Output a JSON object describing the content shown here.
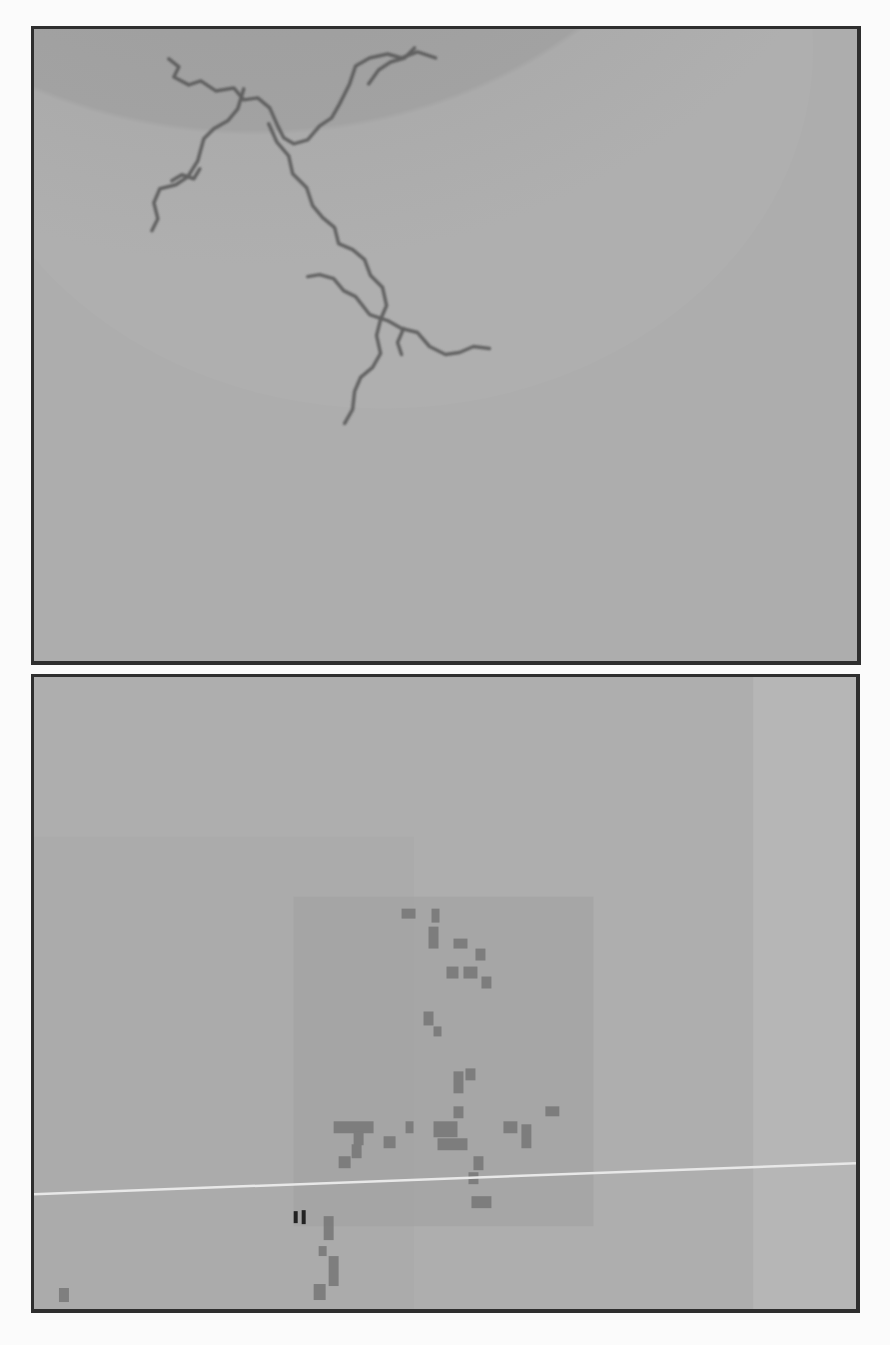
{
  "figure": {
    "panels": [
      {
        "id": "top",
        "description": "Continuous branching dendritic fractal cluster (diffusion-limited aggregation style) in grayscale with circular shaded halo",
        "background_color": "#a9a9a9",
        "halo_color": "#9c9c9c",
        "branch_color": "#555555"
      },
      {
        "id": "bottom",
        "description": "Pixelated/coarse-grained version of a branching cluster with blocky dark squares and a thin light horizontal scan line",
        "background_color": "#acacac",
        "block_color": "#6e6e6e",
        "scanline_color": "#e6e6e6"
      }
    ]
  }
}
